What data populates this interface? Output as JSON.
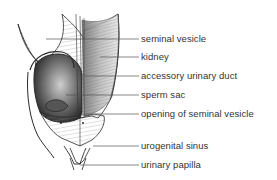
{
  "diagram": {
    "type": "anatomical-illustration",
    "labels": [
      {
        "text": "seminal vesicle",
        "y": 39,
        "target_x": 46
      },
      {
        "text": "kidney",
        "y": 57,
        "target_x": 100
      },
      {
        "text": "accessory urinary duct",
        "y": 76,
        "target_x": 84
      },
      {
        "text": "sperm sac",
        "y": 95,
        "target_x": 66
      },
      {
        "text": "opening of seminal vesicle",
        "y": 114,
        "target_x": 82
      },
      {
        "text": "urogenital sinus",
        "y": 146,
        "target_x": 93
      },
      {
        "text": "urinary papilla",
        "y": 165,
        "target_x": 80
      }
    ],
    "colors": {
      "ink": "#2a2a2a",
      "leader_line": "#555555",
      "label_text": "#333333",
      "background": "#ffffff"
    }
  }
}
